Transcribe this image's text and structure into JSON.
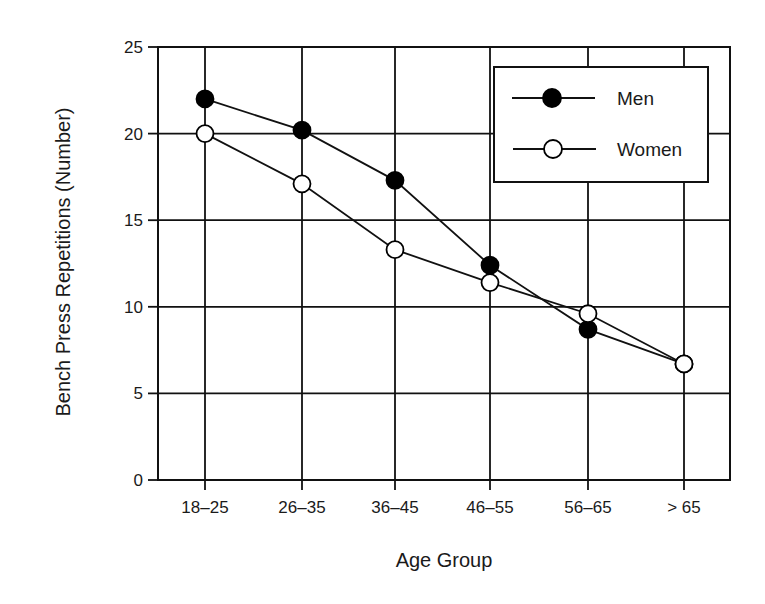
{
  "chart_data": {
    "type": "line",
    "title": "",
    "xlabel": "Age Group",
    "ylabel": "Bench Press Repetitions (Number)",
    "categories": [
      "18–25",
      "26–35",
      "36–45",
      "46–55",
      "56–65",
      "> 65"
    ],
    "ylim": [
      0,
      25
    ],
    "yticks": [
      0,
      5,
      10,
      15,
      20,
      25
    ],
    "grid": true,
    "legend_position": "upper right",
    "series": [
      {
        "name": "Men",
        "marker": "filled-circle",
        "color": "#000000",
        "values": [
          22.0,
          20.2,
          17.3,
          12.4,
          8.7,
          6.7
        ]
      },
      {
        "name": "Women",
        "marker": "open-circle",
        "color": "#000000",
        "values": [
          20.0,
          17.1,
          13.3,
          11.4,
          9.6,
          6.7
        ]
      }
    ]
  },
  "axes": {
    "x_title": "Age Group",
    "y_title": "Bench Press Repetitions (Number)"
  },
  "legend": {
    "items": [
      {
        "label": "Men"
      },
      {
        "label": "Women"
      }
    ]
  }
}
